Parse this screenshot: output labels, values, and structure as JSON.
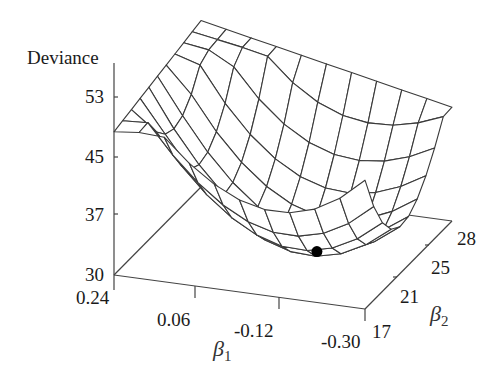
{
  "chart_data": {
    "type": "surface3d",
    "title": "",
    "zlabel": "Deviance",
    "xlabel": "β1",
    "ylabel": "β2",
    "z_ticks": [
      30,
      37,
      45,
      53
    ],
    "x_ticks": [
      0.24,
      0.06,
      -0.12,
      -0.3
    ],
    "y_ticks": [
      17,
      21,
      25,
      28
    ],
    "x_range": [
      0.24,
      -0.3
    ],
    "y_range": [
      17,
      28
    ],
    "z_range": [
      30,
      53
    ],
    "grid": {
      "x_lines": 11,
      "y_lines": 11
    },
    "corner_values": {
      "b1_0.24_b2_17": 48.5,
      "b1_0.24_b2_28": 51.5,
      "b1_-0.30_b2_17": 52.0,
      "b1_-0.30_b2_28": 44.7
    },
    "minimum": {
      "beta1": -0.12,
      "beta2": 21.5,
      "deviance": 31.3,
      "marker": "filled-circle"
    },
    "colors": {
      "mesh": "#3a3a3a",
      "axis": "#444444",
      "marker": "#000000",
      "text": "#1a1a1a"
    }
  },
  "labels": {
    "deviance": "Deviance",
    "z_tick_53": "53",
    "z_tick_45": "45",
    "z_tick_37": "37",
    "z_tick_30": "30",
    "x_tick_024": "0.24",
    "x_tick_006": "0.06",
    "x_tick_m012": "-0.12",
    "x_tick_m030": "-0.30",
    "y_tick_17": "17",
    "y_tick_21": "21",
    "y_tick_25": "25",
    "y_tick_28": "28",
    "beta1_symbol": "β",
    "beta1_sub": "1",
    "beta2_symbol": "β",
    "beta2_sub": "2"
  }
}
